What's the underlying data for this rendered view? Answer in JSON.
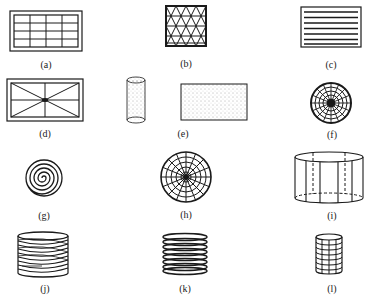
{
  "figure": {
    "panels": [
      {
        "id": "a",
        "label": "(a)",
        "shape": "rectangular frame with 4x4 grid inside double border"
      },
      {
        "id": "b",
        "label": "(b)",
        "shape": "square with triangular lattice"
      },
      {
        "id": "c",
        "label": "(c)",
        "shape": "rectangle with horizontal parallel lines"
      },
      {
        "id": "d",
        "label": "(d)",
        "shape": "rectangle with diagonals and center cross in double border"
      },
      {
        "id": "e",
        "label": "(e)",
        "shape": "dotted cylinder and dotted rectangle"
      },
      {
        "id": "f",
        "label": "(f)",
        "shape": "concentric circles with radial lines, dark center"
      },
      {
        "id": "g",
        "label": "(g)",
        "shape": "spiral"
      },
      {
        "id": "h",
        "label": "(h)",
        "shape": "circle with radial lines and concentric rings"
      },
      {
        "id": "i",
        "label": "(i)",
        "shape": "cylinder with vertical lines and dashed hidden edges"
      },
      {
        "id": "j",
        "label": "(j)",
        "shape": "helical coil cylinder"
      },
      {
        "id": "k",
        "label": "(k)",
        "shape": "stacked ring cylinder"
      },
      {
        "id": "l",
        "label": "(l)",
        "shape": "gridded cylinder"
      }
    ]
  },
  "colors": {
    "stroke": "#1a1a1a",
    "dots": "#555555",
    "background": "#ffffff"
  }
}
